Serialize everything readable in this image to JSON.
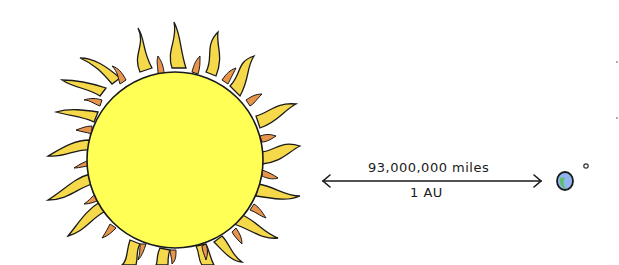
{
  "diagram": {
    "title": "",
    "distance_label": "93,000,000 miles",
    "unit_label": "1 AU",
    "objects": [
      {
        "name": "Sun",
        "fill": "#ffff55",
        "ray_fill": "#f5d94a",
        "inner_ray_fill": "#e8944a"
      },
      {
        "name": "Earth",
        "fill": "#8fb4f0",
        "land": "#5cc06a"
      },
      {
        "name": "Moon",
        "fill": "#333333"
      }
    ],
    "colors": {
      "outline": "#1a1a1a",
      "background": "#ffffff"
    }
  }
}
